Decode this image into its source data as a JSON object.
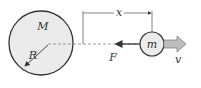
{
  "labels": {
    "big_mass": "M",
    "radius": "R",
    "distance": "x",
    "small_mass": "m",
    "force": "F",
    "velocity": "v"
  },
  "colors": {
    "stroke": "#333333",
    "big_circle_fill": "#ebebeb",
    "small_circle_fill": "#ebebeb",
    "velocity_arrow_fill": "#bdbdbd",
    "dashed_line": "#888888"
  }
}
